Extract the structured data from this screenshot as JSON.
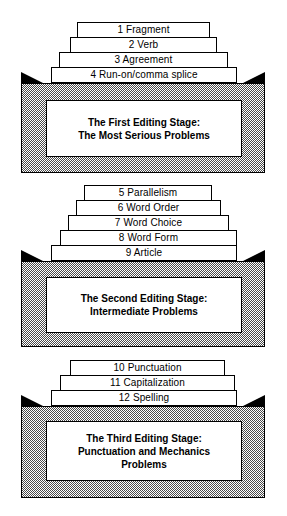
{
  "figure": {
    "type": "stacked-pyramid-diagram",
    "colors": {
      "outline": "#000000",
      "step_fill": "#ffffff",
      "base_fill_pattern": "#4a4a4a",
      "shoulder": "#000000",
      "caption_fill": "#ffffff"
    }
  },
  "stages": [
    {
      "id": "first-editing-stage",
      "steps": [
        {
          "number": "1",
          "label": "1 Fragment"
        },
        {
          "number": "2",
          "label": "2 Verb"
        },
        {
          "number": "3",
          "label": "3 Agreement"
        },
        {
          "number": "4",
          "label": "4 Run-on/comma splice"
        }
      ],
      "caption_lines": [
        "The First Editing Stage:",
        "The Most Serious Problems"
      ]
    },
    {
      "id": "second-editing-stage",
      "steps": [
        {
          "number": "5",
          "label": "5 Parallelism"
        },
        {
          "number": "6",
          "label": "6 Word Order"
        },
        {
          "number": "7",
          "label": "7 Word Choice"
        },
        {
          "number": "8",
          "label": "8 Word Form"
        },
        {
          "number": "9",
          "label": "9 Article"
        }
      ],
      "caption_lines": [
        "The Second Editing Stage:",
        "Intermediate Problems"
      ]
    },
    {
      "id": "third-editing-stage",
      "steps": [
        {
          "number": "10",
          "label": "10 Punctuation"
        },
        {
          "number": "11",
          "label": "11 Capitalization"
        },
        {
          "number": "12",
          "label": "12 Spelling"
        }
      ],
      "caption_lines": [
        "The Third Editing Stage:",
        "Punctuation and Mechanics",
        "Problems"
      ]
    }
  ]
}
